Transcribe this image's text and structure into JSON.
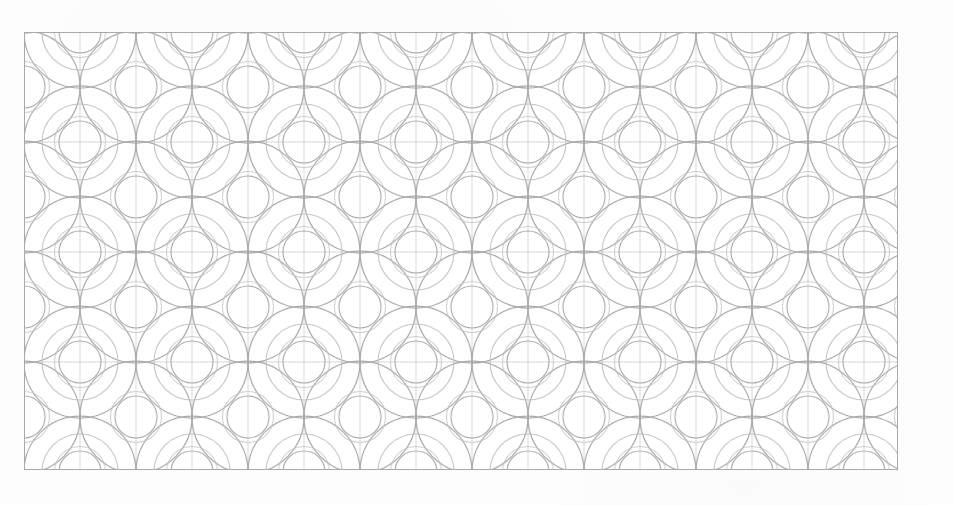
{
  "document": {
    "title": "Geometric Circle Lattice Pattern Swatch",
    "kind": "decorative-pattern",
    "page_background": "#fdfdfd"
  },
  "panel": {
    "name": "pattern-panel",
    "x": 24,
    "y": 32,
    "width": 874,
    "height": 438,
    "fill": "#ffffff",
    "border_color": "#a9a9a9",
    "border_width": 1
  },
  "pattern": {
    "style_name": "overlapping-circles-lattice",
    "description": "Staggered lattice of overlapping thin-stroke circles forming lens and petal intersections, with a concentric smaller circle at each lattice node.",
    "lattice": {
      "arrangement": "staggered",
      "column_spacing": 112,
      "row_spacing": 55,
      "row_offset": 56,
      "origin_x": 0,
      "origin_y": 0
    },
    "circles": {
      "outer_radius": 56,
      "mid_radius": 38,
      "inner_radius": 21,
      "stroke_color": "#a6a6a6",
      "stroke_color_light": "#bfbfbf",
      "stroke_width_outer": 1.25,
      "stroke_width_mid": 1.1,
      "stroke_width_inner": 1.1
    },
    "grid_lines": {
      "enabled": true,
      "stroke_color": "#b5b5b5",
      "stroke_width": 1
    }
  },
  "colors": {
    "line_gray": "#a6a6a6",
    "line_gray_light": "#bfbfbf",
    "border_gray": "#a9a9a9",
    "panel_white": "#ffffff",
    "page_offwhite": "#fdfdfd"
  },
  "labels": {
    "swatch_caption": "Geometric Circle Lattice Pattern Swatch"
  }
}
